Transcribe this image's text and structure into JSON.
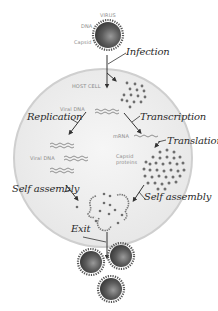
{
  "diagram": {
    "virus": {
      "label": "VIRUS",
      "dna_label": "DNA",
      "capsid_label": "Capsid"
    },
    "host_cell": {
      "label": "HOST CELL"
    },
    "steps": {
      "infection": "Infection",
      "replication": "Replication",
      "transcription": "Transcription",
      "translation": "Translation",
      "self_assembly_left": "Self assembly",
      "self_assembly_right": "Self assembly",
      "exit": "Exit"
    },
    "molecules": {
      "viral_dna_top": "Viral DNA",
      "viral_dna_replicated": "Viral DNA",
      "mrna": "mRNA",
      "capsid_proteins_line1": "Capsid",
      "capsid_proteins_line2": "proteins"
    },
    "colors": {
      "cell_fill": "#ececec",
      "cell_border": "#c8c8c8",
      "virus_body": "#5a5a5a",
      "protein_dot": "#6e6e6e",
      "arrow": "#333333"
    }
  }
}
